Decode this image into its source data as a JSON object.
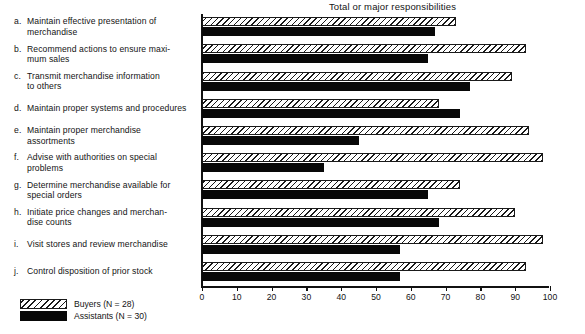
{
  "chart_data": {
    "type": "bar",
    "orientation": "horizontal",
    "title": "Total or major responsibilities",
    "xlabel": "",
    "ylabel": "",
    "xlim": [
      0,
      100
    ],
    "xticks": [
      0,
      10,
      20,
      30,
      40,
      50,
      60,
      70,
      80,
      90,
      100
    ],
    "grid": false,
    "legend_position": "bottom-left",
    "categories": [
      "a. Maintain effective presentation of merchandise",
      "b. Recommend actions to ensure maximum sales",
      "c. Transmit merchandise information to others",
      "d. Maintain proper systems and procedures",
      "e. Maintain proper merchandise assortments",
      "f. Advise with authorities on special problems",
      "g. Determine merchandise available for special orders",
      "h. Initiate price changes and merchandise counts",
      "i. Visit stores and review merchandise",
      "j. Control disposition of prior stock"
    ],
    "series": [
      {
        "name": "Buyers (N = 28)",
        "values": [
          73,
          93,
          89,
          68,
          94,
          98,
          74,
          90,
          98,
          93
        ]
      },
      {
        "name": "Assistants (N = 30)",
        "values": [
          67,
          65,
          77,
          74,
          45,
          35,
          65,
          68,
          57,
          57
        ]
      }
    ]
  },
  "labels": [
    {
      "letter": "a.",
      "lines": [
        "Maintain effective presentation of",
        "merchandise"
      ]
    },
    {
      "letter": "b.",
      "lines": [
        "Recommend actions to ensure maxi-",
        "mum sales"
      ]
    },
    {
      "letter": "c.",
      "lines": [
        "Transmit merchandise information",
        "to others"
      ]
    },
    {
      "letter": "d.",
      "lines": [
        "Maintain proper systems and procedures"
      ]
    },
    {
      "letter": "e.",
      "lines": [
        "Maintain proper merchandise",
        "assortments"
      ]
    },
    {
      "letter": "f.",
      "lines": [
        "Advise with authorities on special",
        "problems"
      ]
    },
    {
      "letter": "g.",
      "lines": [
        "Determine merchandise available for",
        "special orders"
      ]
    },
    {
      "letter": "h.",
      "lines": [
        "Initiate price changes and merchan-",
        "dise counts"
      ]
    },
    {
      "letter": "i.",
      "lines": [
        "Visit stores and review merchandise"
      ]
    },
    {
      "letter": "j.",
      "lines": [
        "Control disposition of prior stock"
      ]
    }
  ],
  "legend": {
    "buyers_label": "Buyers (N = 28)",
    "assistants_label": "Assistants (N = 30)"
  },
  "colors": {
    "ink": "#111111",
    "buyers_fill": "#ffffff",
    "assistants_fill": "#080808",
    "background": "#ffffff"
  }
}
